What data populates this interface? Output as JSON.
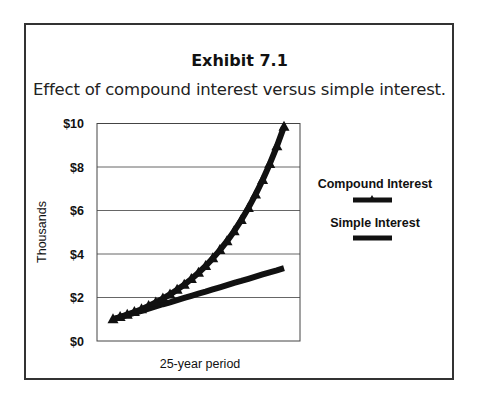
{
  "exhibit": {
    "title": "Exhibit 7.1",
    "subtitle": "Effect of compound interest versus simple interest."
  },
  "chart_data": {
    "type": "line",
    "title": "Exhibit 7.1",
    "subtitle": "Effect of compound interest versus simple interest.",
    "xlabel": "25-year period",
    "ylabel": "Thousands",
    "xlim": [
      0,
      25
    ],
    "ylim": [
      0,
      10
    ],
    "yticks": [
      0,
      2,
      4,
      6,
      8,
      10
    ],
    "ytick_labels": [
      "$0",
      "$2",
      "$4",
      "$6",
      "$8",
      "$10"
    ],
    "grid": "horizontal",
    "legend_position": "right",
    "x": [
      0,
      1,
      2,
      3,
      4,
      5,
      6,
      7,
      8,
      9,
      10,
      11,
      12,
      13,
      14,
      15,
      16,
      17,
      18,
      19,
      20,
      21,
      22,
      23,
      24
    ],
    "series": [
      {
        "name": "Compound Interest",
        "marker": "triangle",
        "values": [
          1.0,
          1.1,
          1.21,
          1.33,
          1.46,
          1.61,
          1.77,
          1.95,
          2.14,
          2.36,
          2.59,
          2.85,
          3.14,
          3.45,
          3.8,
          4.18,
          4.59,
          5.05,
          5.56,
          6.12,
          6.73,
          7.4,
          8.14,
          8.95,
          9.85
        ]
      },
      {
        "name": "Simple Interest",
        "marker": "none",
        "values": [
          1.0,
          1.1,
          1.2,
          1.29,
          1.39,
          1.49,
          1.59,
          1.69,
          1.78,
          1.88,
          1.98,
          2.08,
          2.18,
          2.27,
          2.37,
          2.47,
          2.57,
          2.67,
          2.76,
          2.86,
          2.96,
          3.06,
          3.16,
          3.25,
          3.35
        ]
      }
    ]
  }
}
